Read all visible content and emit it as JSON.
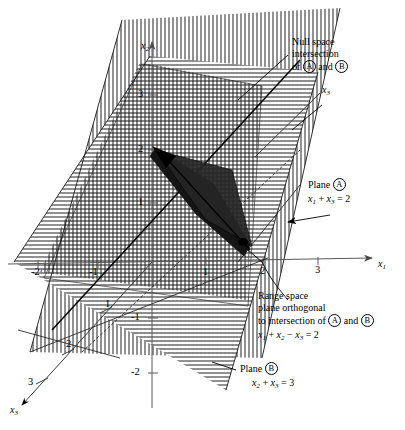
{
  "figure": {
    "kind": "3d-linear-algebra-plane-diagram",
    "axes": {
      "x1": {
        "label": "x",
        "sub": "1",
        "direction": "right",
        "ticks": [
          "-2",
          "-1",
          "1",
          "2",
          "3"
        ]
      },
      "x2": {
        "label": "x",
        "sub": "2",
        "direction": "up",
        "ticks": [
          "3",
          "2",
          "1",
          "-1",
          "-2"
        ]
      },
      "x3": {
        "label": "x",
        "sub": "3",
        "direction": "down-left",
        "ticks": [
          "1",
          "2",
          "3"
        ]
      },
      "x3_neg": {
        "label": "x",
        "sub": "3",
        "direction": "up-right"
      }
    }
  },
  "annotations": {
    "null_space": {
      "line1": "Null space",
      "line2": "intersection",
      "line3_pre": "of ",
      "line3_a": "A",
      "line3_mid": " and ",
      "line3_b": "B"
    },
    "plane_a": {
      "title_pre": "Plane ",
      "title_tag": "A",
      "eq_x": "x",
      "eq_s1": "1",
      "eq_plus": " + ",
      "eq_x2": "x",
      "eq_s2": "3",
      "eq_tail": " = 2",
      "equation": "x1 + x3 = 2"
    },
    "plane_b": {
      "title_pre": "Plane ",
      "title_tag": "B",
      "equation": "x2 + x3 = 3"
    },
    "range_space": {
      "line1": "Range space",
      "line2": "plane orthogonal",
      "line3_pre": "to intersection of ",
      "line3_a": "A",
      "line3_mid": " and ",
      "line3_b": "B",
      "equation": "x1 + x2 - x3 = 2"
    }
  },
  "ticks": {
    "x1_neg2": "-2",
    "x1_neg1": "-1",
    "x1_1": "1",
    "x1_2": "2",
    "x1_3": "3",
    "x2_3": "3",
    "x2_2": "2",
    "x2_1": "1",
    "x2_neg1": "-1",
    "x2_neg2": "-2",
    "x3_1": "1",
    "x3_2": "2",
    "x3_3": "3"
  },
  "colors": {
    "ink": "#000000",
    "axis": "#555555",
    "hatch": "#333333",
    "dark_plane": "#1a1a1a"
  }
}
